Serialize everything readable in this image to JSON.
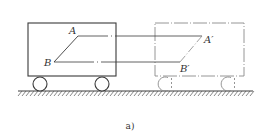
{
  "figure": {
    "caption": "a)",
    "colors": {
      "solid": "#3a3a3a",
      "ghost": "#8a8a8a",
      "hatch": "#555555",
      "background": "#ffffff"
    },
    "cart_original": {
      "style": "solid",
      "body": {
        "x": 28,
        "y": 23,
        "w": 88,
        "h": 53
      },
      "wheels": [
        {
          "cx": 40,
          "cy": 84,
          "r": 7
        },
        {
          "cx": 102,
          "cy": 84,
          "r": 7
        }
      ]
    },
    "cart_translated": {
      "style": "dash-dot",
      "body": {
        "x": 155,
        "y": 23,
        "w": 89,
        "h": 53
      },
      "wheels": [
        {
          "cx": 165,
          "cy": 84,
          "r": 7
        },
        {
          "cx": 228,
          "cy": 84,
          "r": 7
        }
      ]
    },
    "ground": {
      "x1": 18,
      "x2": 253,
      "y": 91
    },
    "points": {
      "A": {
        "label": "A",
        "x": 78,
        "y": 36
      },
      "B": {
        "label": "B",
        "x": 54,
        "y": 62
      },
      "A_prime": {
        "label": "A′",
        "x": 202,
        "y": 36
      },
      "B_prime": {
        "label": "B′",
        "x": 180,
        "y": 62
      }
    }
  }
}
